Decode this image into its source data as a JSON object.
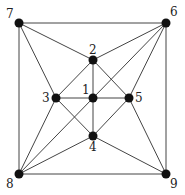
{
  "graph": {
    "nodes": [
      {
        "id": "1",
        "x": 93,
        "y": 98,
        "label": "1",
        "lx": -11,
        "ly": -4
      },
      {
        "id": "2",
        "x": 93,
        "y": 60,
        "label": "2",
        "lx": -4,
        "ly": -6
      },
      {
        "id": "3",
        "x": 56,
        "y": 98,
        "label": "3",
        "lx": -14,
        "ly": 4
      },
      {
        "id": "4",
        "x": 93,
        "y": 136,
        "label": "4",
        "lx": -4,
        "ly": 15
      },
      {
        "id": "5",
        "x": 129,
        "y": 98,
        "label": "5",
        "lx": 6,
        "ly": 4
      },
      {
        "id": "6",
        "x": 166,
        "y": 23,
        "label": "6",
        "lx": 4,
        "ly": -7
      },
      {
        "id": "7",
        "x": 19,
        "y": 23,
        "label": "7",
        "lx": -13,
        "ly": -5
      },
      {
        "id": "8",
        "x": 19,
        "y": 174,
        "label": "8",
        "lx": -13,
        "ly": 14
      },
      {
        "id": "9",
        "x": 166,
        "y": 174,
        "label": "9",
        "lx": 4,
        "ly": 14
      }
    ],
    "edges": [
      [
        "7",
        "6"
      ],
      [
        "6",
        "9"
      ],
      [
        "9",
        "8"
      ],
      [
        "8",
        "7"
      ],
      [
        "7",
        "2"
      ],
      [
        "7",
        "3"
      ],
      [
        "6",
        "2"
      ],
      [
        "6",
        "5"
      ],
      [
        "6",
        "1"
      ],
      [
        "8",
        "3"
      ],
      [
        "8",
        "4"
      ],
      [
        "8",
        "1"
      ],
      [
        "9",
        "4"
      ],
      [
        "9",
        "5"
      ],
      [
        "1",
        "2"
      ],
      [
        "1",
        "3"
      ],
      [
        "1",
        "4"
      ],
      [
        "1",
        "5"
      ],
      [
        "2",
        "3"
      ],
      [
        "2",
        "5"
      ],
      [
        "3",
        "4"
      ],
      [
        "4",
        "5"
      ]
    ]
  }
}
